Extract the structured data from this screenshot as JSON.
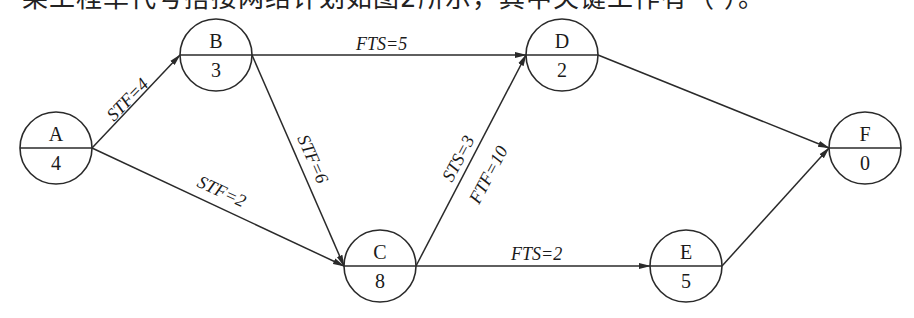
{
  "caption": "某工程单代号搭接网络计划如图2所示，其中关键工作有（    ）。",
  "nodes": [
    {
      "id": "A",
      "duration": "4",
      "cx": 56,
      "cy": 148
    },
    {
      "id": "B",
      "duration": "3",
      "cx": 216,
      "cy": 55
    },
    {
      "id": "C",
      "duration": "8",
      "cx": 380,
      "cy": 266
    },
    {
      "id": "D",
      "duration": "2",
      "cx": 562,
      "cy": 55
    },
    {
      "id": "E",
      "duration": "5",
      "cx": 686,
      "cy": 266
    },
    {
      "id": "F",
      "duration": "0",
      "cx": 865,
      "cy": 148
    }
  ],
  "edges": [
    {
      "from": "A",
      "to": "B",
      "label": "STF=4"
    },
    {
      "from": "A",
      "to": "C",
      "label": "STF=2"
    },
    {
      "from": "B",
      "to": "D",
      "label": "FTS=5"
    },
    {
      "from": "B",
      "to": "C",
      "label": "STF=6"
    },
    {
      "from": "C",
      "to": "D",
      "label": "STS=3",
      "label2": "FTF=10"
    },
    {
      "from": "C",
      "to": "E",
      "label": "FTS=2"
    },
    {
      "from": "D",
      "to": "F",
      "label": ""
    },
    {
      "from": "E",
      "to": "F",
      "label": ""
    }
  ]
}
